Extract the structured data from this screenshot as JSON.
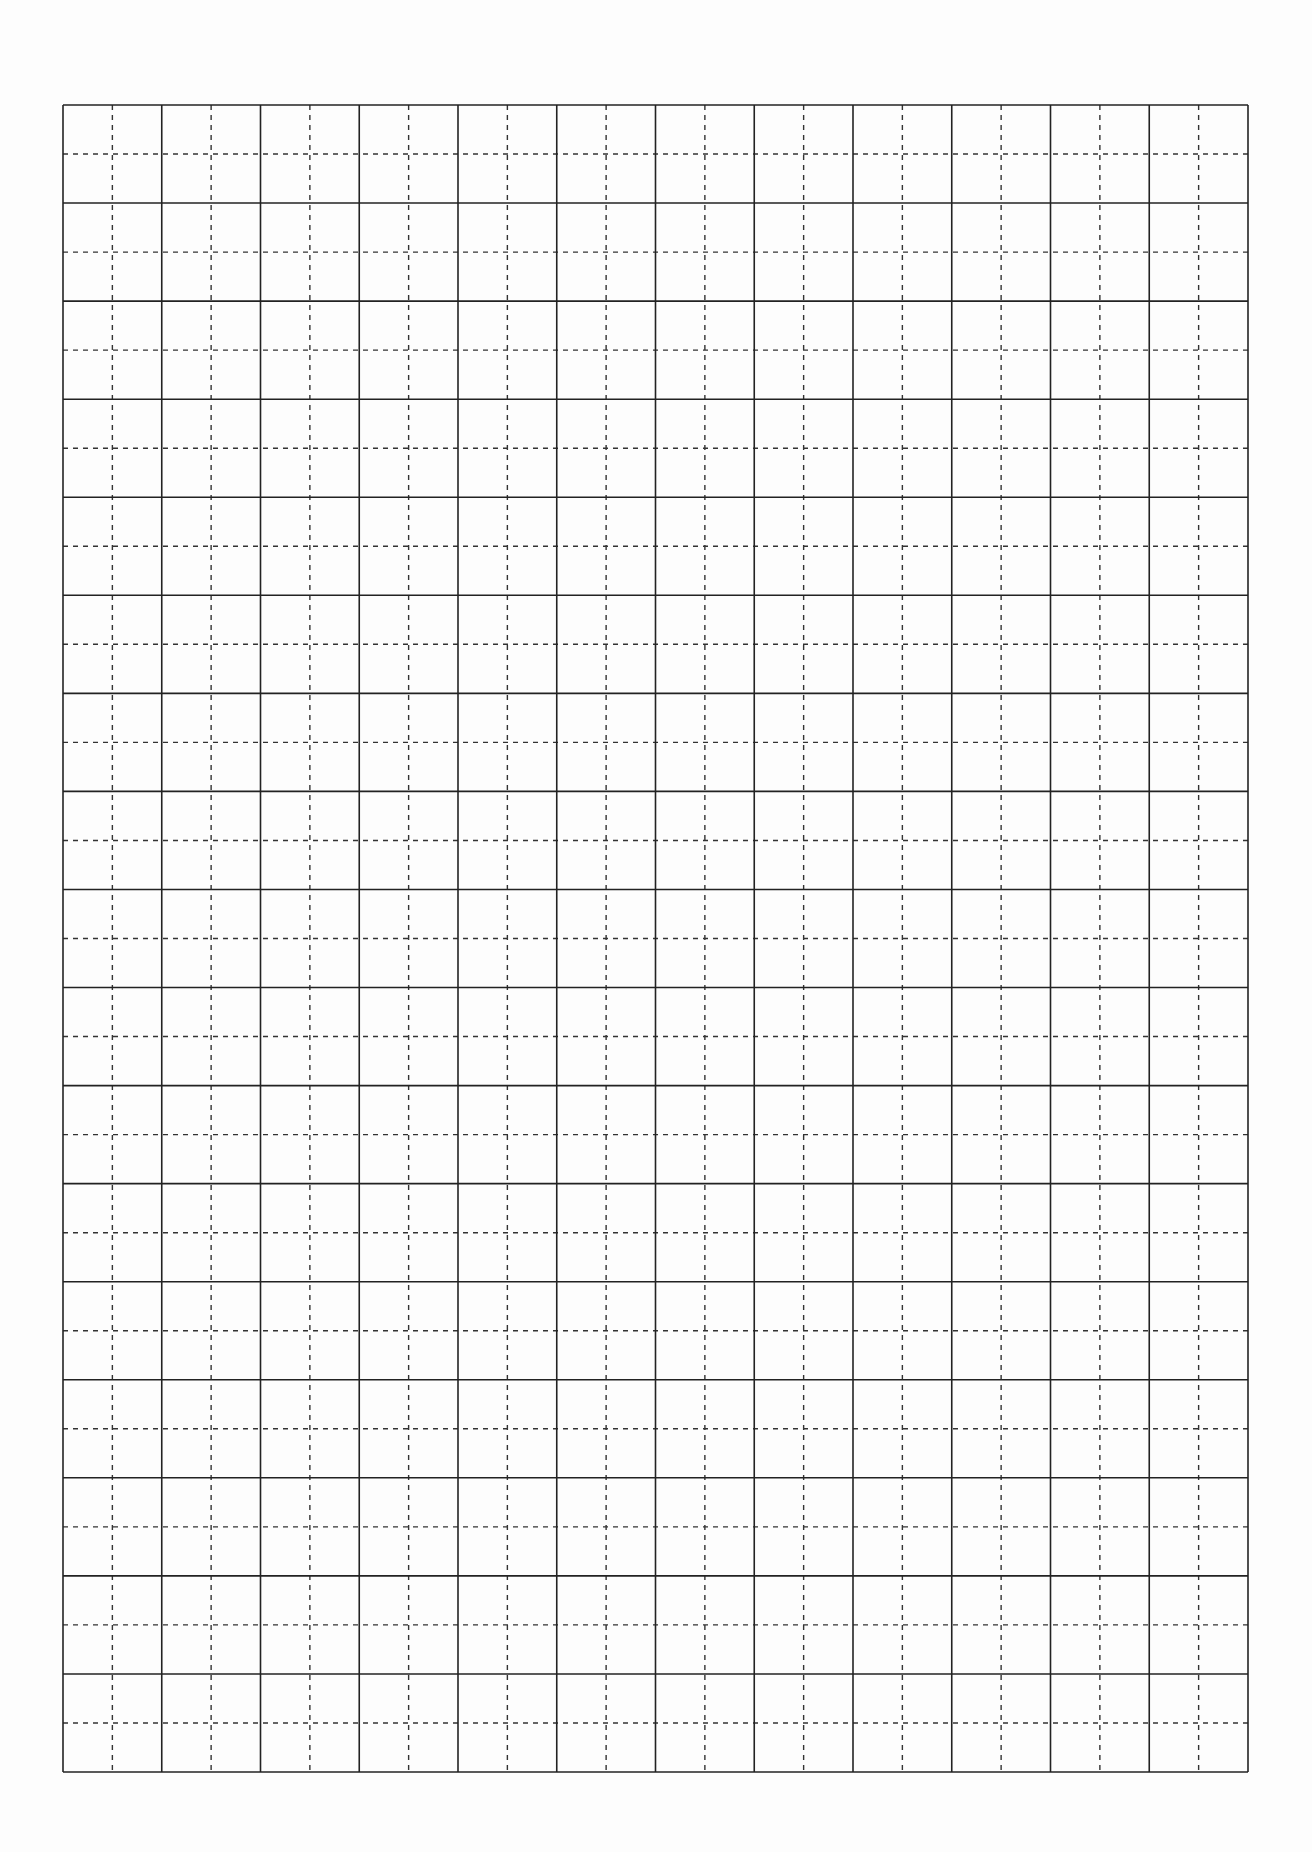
{
  "page": {
    "type": "tianzige-practice-sheet",
    "background": "#fdfdfd"
  },
  "grid": {
    "columns": 12,
    "rows": 17,
    "left": 63,
    "top": 105,
    "width": 1185,
    "height": 1667,
    "solid_line_color": "#222222",
    "solid_line_width": 1.6,
    "dashed_line_color": "#333333",
    "dashed_line_width": 1.4,
    "dash_pattern": "5 5",
    "cell_guides": [
      "vertical-center-dashed",
      "horizontal-center-dashed"
    ]
  }
}
